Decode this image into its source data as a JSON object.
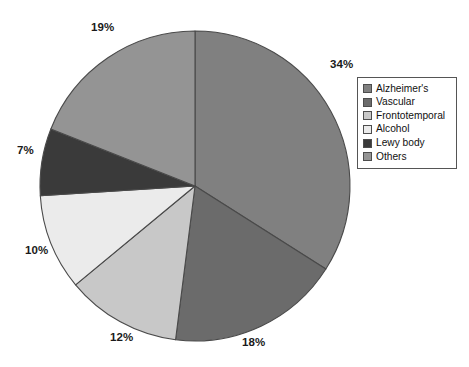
{
  "chart_data": {
    "type": "pie",
    "title": "",
    "subtitle": "",
    "xlabel": "",
    "ylabel": "",
    "categories": [
      "Alzheimer's",
      "Vascular",
      "Frontotemporal",
      "Alcohol",
      "Lewy body",
      "Others"
    ],
    "values": [
      34,
      18,
      12,
      10,
      7,
      19
    ],
    "value_unit": "%",
    "data_labels": [
      "34%",
      "18%",
      "12%",
      "10%",
      "7%",
      "19%"
    ],
    "slice_colors": [
      "#808080",
      "#6b6b6b",
      "#c8c8c8",
      "#ebebeb",
      "#3a3a3a",
      "#949494"
    ],
    "start_angle_deg": 0,
    "direction": "clockwise",
    "grid": false,
    "legend_position": "right",
    "legend_entries": [
      {
        "label": "Alzheimer's",
        "color": "#808080"
      },
      {
        "label": "Vascular",
        "color": "#6b6b6b"
      },
      {
        "label": "Frontotemporal",
        "color": "#c8c8c8"
      },
      {
        "label": "Alcohol",
        "color": "#ebebeb"
      },
      {
        "label": "Lewy body",
        "color": "#3a3a3a"
      },
      {
        "label": "Others",
        "color": "#949494"
      }
    ],
    "slices": [
      {
        "name": "Alzheimer's",
        "value": 34,
        "label": "34%",
        "color": "#808080",
        "label_x": 330,
        "label_y": 58
      },
      {
        "name": "Vascular",
        "value": 18,
        "label": "18%",
        "color": "#6b6b6b",
        "label_x": 242,
        "label_y": 336
      },
      {
        "name": "Frontotemporal",
        "value": 12,
        "label": "12%",
        "color": "#c8c8c8",
        "label_x": 110,
        "label_y": 331
      },
      {
        "name": "Alcohol",
        "value": 10,
        "label": "10%",
        "color": "#ebebeb",
        "label_x": 25,
        "label_y": 244
      },
      {
        "name": "Lewy body",
        "value": 7,
        "label": "7%",
        "color": "#3a3a3a",
        "label_x": 17,
        "label_y": 144
      },
      {
        "name": "Others",
        "value": 19,
        "label": "19%",
        "color": "#949494",
        "label_x": 91,
        "label_y": 21
      }
    ]
  },
  "geometry": {
    "center_x": 195,
    "center_y": 186,
    "radius": 155
  }
}
